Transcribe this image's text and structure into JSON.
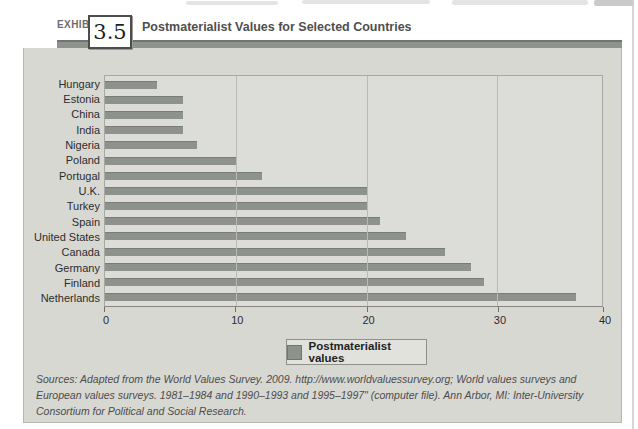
{
  "header": {
    "exhibit_label": "EXHIBIT",
    "exhibit_number": "3.5",
    "title": "Postmaterialist Values for Selected Countries"
  },
  "chart_data": {
    "type": "bar",
    "orientation": "horizontal",
    "title": "Postmaterialist Values for Selected Countries",
    "categories": [
      "Hungary",
      "Estonia",
      "China",
      "India",
      "Nigeria",
      "Poland",
      "Portugal",
      "U.K.",
      "Turkey",
      "Spain",
      "United States",
      "Canada",
      "Germany",
      "Finland",
      "Netherlands"
    ],
    "values": [
      4,
      6,
      6,
      6,
      7,
      10,
      12,
      20,
      20,
      21,
      23,
      26,
      28,
      29,
      36
    ],
    "xlabel": "",
    "ylabel": "",
    "xlim": [
      0,
      40
    ],
    "xticks": [
      0,
      10,
      20,
      30,
      40
    ],
    "gridlines_at": [
      10,
      20,
      30
    ],
    "plot_right_edge_value": 38,
    "grid": true,
    "legend_position": "bottom-center",
    "legend_label": "Postmaterialist values",
    "bar_color": "#8d928d"
  },
  "legend": {
    "label": "Postmaterialist values"
  },
  "sources": {
    "text": "Sources: Adapted from the World Values Survey. 2009. http://www.worldvaluessurvey.org; World values surveys and European values surveys. 1981–1984 and 1990–1993 and 1995–1997\" (computer file). Ann Arbor, MI: Inter-University Consortium for Political and Social Research."
  },
  "colors": {
    "band": "#8e938e",
    "panel_background": "#d8d8d3",
    "plot_background": "#dcddd9",
    "bar": "#8d928d"
  }
}
